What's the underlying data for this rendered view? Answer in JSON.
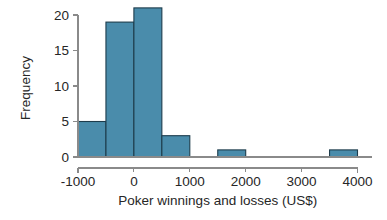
{
  "chart_data": {
    "type": "bar",
    "title": "",
    "subtitle": "",
    "xlabel": "Poker winnings and losses (US$)",
    "ylabel": "Frequency",
    "xlim": [
      -1000,
      4000
    ],
    "ylim": [
      0,
      20
    ],
    "grid": false,
    "legend": null,
    "bin_width": 500,
    "bar_color": "#4a8cab",
    "bar_edge_color": "#1d3c4c",
    "axis_color": "#8a8a8a",
    "xticks": [
      -1000,
      0,
      1000,
      2000,
      3000,
      4000
    ],
    "xtick_labels": [
      "-1000",
      "0",
      "1000",
      "2000",
      "3000",
      "4000"
    ],
    "yticks": [
      0,
      5,
      10,
      15,
      20
    ],
    "ytick_labels": [
      "0",
      "5",
      "10",
      "15",
      "20"
    ],
    "bins": [
      {
        "label": "-1000 to -500",
        "x0": -1000,
        "x1": -500,
        "value": 5
      },
      {
        "label": "-500 to 0",
        "x0": -500,
        "x1": 0,
        "value": 19
      },
      {
        "label": "0 to 500",
        "x0": 0,
        "x1": 500,
        "value": 21
      },
      {
        "label": "500 to 1000",
        "x0": 500,
        "x1": 1000,
        "value": 3
      },
      {
        "label": "1000 to 1500",
        "x0": 1000,
        "x1": 1500,
        "value": 0
      },
      {
        "label": "1500 to 2000",
        "x0": 1500,
        "x1": 2000,
        "value": 1
      },
      {
        "label": "2000 to 2500",
        "x0": 2000,
        "x1": 2500,
        "value": 0
      },
      {
        "label": "2500 to 3000",
        "x0": 2500,
        "x1": 3000,
        "value": 0
      },
      {
        "label": "3000 to 3500",
        "x0": 3000,
        "x1": 3500,
        "value": 0
      },
      {
        "label": "3500 to 4000",
        "x0": 3500,
        "x1": 4000,
        "value": 1
      }
    ],
    "categories": [
      "-1000 to -500",
      "-500 to 0",
      "0 to 500",
      "500 to 1000",
      "1000 to 1500",
      "1500 to 2000",
      "2000 to 2500",
      "2500 to 3000",
      "3000 to 3500",
      "3500 to 4000"
    ],
    "values": [
      5,
      19,
      21,
      3,
      0,
      1,
      0,
      0,
      0,
      1
    ]
  }
}
